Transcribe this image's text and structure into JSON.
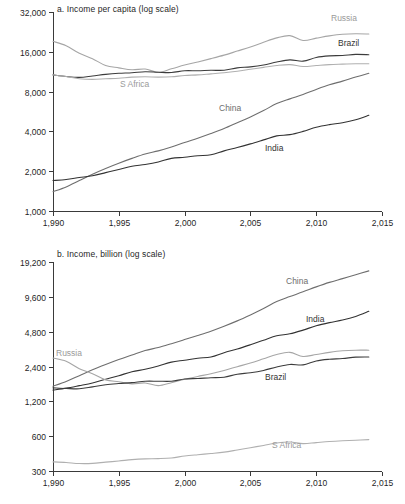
{
  "figure": {
    "background": "#ffffff",
    "width": 405,
    "height": 504
  },
  "colors": {
    "russia": "#a6a6a6",
    "brazil": "#3c3c3c",
    "s_africa": "#b0b0b0",
    "china": "#6e6e6e",
    "india": "#333333",
    "axis": "#3a3a3a",
    "text": "#1f1f1f",
    "label_light": "#9a9a9a",
    "label_mid": "#6e6e6e",
    "label_dark": "#333333"
  },
  "panel_a": {
    "title": "a. Income per capita (log scale)",
    "ylabel": "",
    "xlabel": "",
    "yticks": [
      "1,000",
      "2,000",
      "4,000",
      "8,000",
      "16,000",
      "32,000"
    ],
    "xticks": [
      "1990",
      "1995",
      "2000",
      "2005",
      "2010",
      "2015"
    ],
    "series_labels": [
      {
        "name": "Russia",
        "text": "Russia",
        "color_key": "label_light"
      },
      {
        "name": "Brazil",
        "text": "Brazil",
        "color_key": "label_dark"
      },
      {
        "name": "S Africa",
        "text": "S Africa",
        "color_key": "label_light"
      },
      {
        "name": "China",
        "text": "China",
        "color_key": "label_mid"
      },
      {
        "name": "India",
        "text": "India",
        "color_key": "label_dark"
      }
    ]
  },
  "panel_b": {
    "title": "b. Income, billion (log scale)",
    "ylabel": "",
    "xlabel": "",
    "yticks": [
      "300",
      "600",
      "1,200",
      "2,400",
      "4,800",
      "9,600",
      "19,200"
    ],
    "xticks": [
      "1990",
      "1995",
      "2000",
      "2005",
      "2010",
      "2015"
    ],
    "series_labels": [
      {
        "name": "China",
        "text": "China",
        "color_key": "label_mid"
      },
      {
        "name": "India",
        "text": "India",
        "color_key": "label_dark"
      },
      {
        "name": "Russia",
        "text": "Russia",
        "color_key": "label_light"
      },
      {
        "name": "Brazil",
        "text": "Brazil",
        "color_key": "label_dark"
      },
      {
        "name": "S Africa",
        "text": "S Africa",
        "color_key": "label_light"
      }
    ]
  },
  "chart_data": [
    {
      "id": "panel_a",
      "type": "line",
      "title": "a. Income per capita (log scale)",
      "xlabel": "",
      "ylabel": "Income per capita (log scale)",
      "yscale": "log2",
      "ylim": [
        1000,
        32000
      ],
      "xlim": [
        1990,
        2015
      ],
      "yticks": [
        1000,
        2000,
        4000,
        8000,
        16000,
        32000
      ],
      "xticks": [
        1990,
        1995,
        2000,
        2005,
        2010,
        2015
      ],
      "grid": false,
      "legend": "inline-annotations",
      "x": [
        1990,
        1991,
        1992,
        1993,
        1994,
        1995,
        1996,
        1997,
        1998,
        1999,
        2000,
        2001,
        2002,
        2003,
        2004,
        2005,
        2006,
        2007,
        2008,
        2009,
        2010,
        2011,
        2012,
        2013,
        2014
      ],
      "series": [
        {
          "name": "Russia",
          "color": "#a6a6a6",
          "values": [
            19200,
            17800,
            15600,
            14200,
            12600,
            12100,
            11700,
            11850,
            11200,
            11900,
            12700,
            13400,
            14200,
            15100,
            16200,
            17400,
            18900,
            20400,
            21200,
            19500,
            20300,
            21100,
            21700,
            21900,
            21800
          ]
        },
        {
          "name": "Brazil",
          "color": "#3c3c3c",
          "values": [
            10700,
            10400,
            10250,
            10500,
            10800,
            11000,
            11100,
            11300,
            11200,
            11150,
            11500,
            11500,
            11600,
            11600,
            12100,
            12300,
            12700,
            13400,
            13900,
            13600,
            14500,
            14900,
            15000,
            15300,
            15200
          ]
        },
        {
          "name": "S Africa",
          "color": "#b0b0b0",
          "values": [
            10700,
            10400,
            10000,
            9900,
            10000,
            10100,
            10300,
            10350,
            10300,
            10350,
            10600,
            10700,
            10900,
            11100,
            11400,
            11800,
            12200,
            12600,
            12800,
            12400,
            12600,
            12800,
            12900,
            13000,
            13000
          ]
        },
        {
          "name": "China",
          "color": "#6e6e6e",
          "values": [
            1400,
            1520,
            1700,
            1900,
            2100,
            2300,
            2500,
            2700,
            2850,
            3050,
            3300,
            3550,
            3850,
            4200,
            4650,
            5150,
            5750,
            6500,
            7050,
            7600,
            8300,
            9000,
            9600,
            10300,
            11000
          ]
        },
        {
          "name": "India",
          "color": "#333333",
          "values": [
            1700,
            1730,
            1790,
            1850,
            1950,
            2060,
            2180,
            2250,
            2350,
            2500,
            2550,
            2620,
            2660,
            2850,
            3020,
            3220,
            3450,
            3700,
            3780,
            4000,
            4300,
            4500,
            4650,
            4900,
            5300
          ]
        }
      ]
    },
    {
      "id": "panel_b",
      "type": "line",
      "title": "b. Income, billion (log scale)",
      "xlabel": "",
      "ylabel": "Income, billion (log scale)",
      "yscale": "log2",
      "ylim": [
        300,
        19200
      ],
      "xlim": [
        1990,
        2015
      ],
      "yticks": [
        300,
        600,
        1200,
        2400,
        4800,
        9600,
        19200
      ],
      "xticks": [
        1990,
        1995,
        2000,
        2005,
        2010,
        2015
      ],
      "grid": false,
      "legend": "inline-annotations",
      "x": [
        1990,
        1991,
        1992,
        1993,
        1994,
        1995,
        1996,
        1997,
        1998,
        1999,
        2000,
        2001,
        2002,
        2003,
        2004,
        2005,
        2006,
        2007,
        2008,
        2009,
        2010,
        2011,
        2012,
        2013,
        2014
      ],
      "series": [
        {
          "name": "China",
          "color": "#6e6e6e",
          "values": [
            1620,
            1780,
            2000,
            2250,
            2500,
            2760,
            3020,
            3300,
            3500,
            3780,
            4100,
            4450,
            4850,
            5350,
            5950,
            6700,
            7600,
            8750,
            9650,
            10600,
            11700,
            12800,
            13800,
            14900,
            16100
          ]
        },
        {
          "name": "India",
          "color": "#333333",
          "values": [
            1500,
            1560,
            1640,
            1730,
            1860,
            2000,
            2160,
            2270,
            2420,
            2620,
            2720,
            2830,
            2900,
            3160,
            3400,
            3700,
            4050,
            4420,
            4600,
            4950,
            5400,
            5750,
            6050,
            6500,
            7200
          ]
        },
        {
          "name": "Russia",
          "color": "#a6a6a6",
          "values": [
            2840,
            2660,
            2300,
            2080,
            1840,
            1770,
            1700,
            1730,
            1640,
            1740,
            1860,
            1970,
            2080,
            2220,
            2390,
            2570,
            2800,
            3050,
            3180,
            2930,
            3050,
            3180,
            3280,
            3320,
            3320
          ]
        },
        {
          "name": "Brazil",
          "color": "#3c3c3c",
          "values": [
            1570,
            1550,
            1540,
            1600,
            1670,
            1710,
            1740,
            1790,
            1790,
            1790,
            1870,
            1890,
            1920,
            1940,
            2060,
            2120,
            2220,
            2380,
            2500,
            2480,
            2680,
            2770,
            2810,
            2890,
            2900
          ]
        },
        {
          "name": "S Africa",
          "color": "#b0b0b0",
          "values": [
            360,
            355,
            348,
            349,
            358,
            366,
            376,
            382,
            384,
            389,
            404,
            415,
            425,
            437,
            456,
            477,
            499,
            523,
            534,
            517,
            528,
            539,
            547,
            553,
            560
          ]
        }
      ]
    }
  ]
}
